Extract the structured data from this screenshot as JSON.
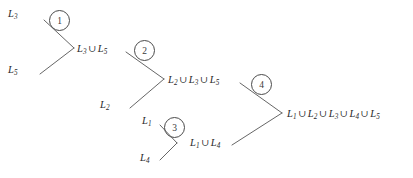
{
  "diagram": {
    "type": "merge-tree",
    "background_color": "#ffffff",
    "line_color": "#555555",
    "text_color": "#2a2a2a",
    "leaves": [
      {
        "id": "leaf-l3",
        "text": "L3",
        "base": "L",
        "sub": "3",
        "x": 8,
        "y": 14
      },
      {
        "id": "leaf-l5",
        "text": "L5",
        "base": "L",
        "sub": "5",
        "x": 8,
        "y": 70
      },
      {
        "id": "leaf-l2",
        "text": "L2",
        "base": "L",
        "sub": "2",
        "x": 100,
        "y": 105
      },
      {
        "id": "leaf-l1",
        "text": "L1",
        "base": "L",
        "sub": "1",
        "x": 142,
        "y": 121
      },
      {
        "id": "leaf-l4",
        "text": "L4",
        "base": "L",
        "sub": "4",
        "x": 140,
        "y": 158
      }
    ],
    "merge_results": [
      {
        "id": "result-1",
        "text": "L3 U L5",
        "x": 77,
        "y": 49,
        "parts": [
          "3",
          "5"
        ]
      },
      {
        "id": "result-2",
        "text": "L2 U L3 U L5",
        "x": 168,
        "y": 80,
        "parts": [
          "2",
          "3",
          "5"
        ]
      },
      {
        "id": "result-3",
        "text": "L1 U L4",
        "x": 190,
        "y": 143,
        "parts": [
          "1",
          "4"
        ]
      },
      {
        "id": "result-4",
        "text": "L1 U L2 U L3 U L4 U L5",
        "x": 287,
        "y": 114,
        "parts": [
          "1",
          "2",
          "3",
          "4",
          "5"
        ]
      }
    ],
    "steps": [
      {
        "id": "step-1",
        "number": "1",
        "x": 49,
        "y": 10
      },
      {
        "id": "step-2",
        "number": "2",
        "x": 134,
        "y": 40
      },
      {
        "id": "step-3",
        "number": "3",
        "x": 164,
        "y": 117
      },
      {
        "id": "step-4",
        "number": "4",
        "x": 251,
        "y": 74
      }
    ],
    "edges": [
      {
        "id": "edge-l3-to-m1",
        "from": [
          44,
          20
        ],
        "to": [
          74,
          48
        ]
      },
      {
        "id": "edge-l5-to-m1",
        "from": [
          40,
          74
        ],
        "to": [
          74,
          48
        ]
      },
      {
        "id": "edge-m1-to-m2",
        "from": [
          126,
          52
        ],
        "to": [
          164,
          79
        ]
      },
      {
        "id": "edge-l2-to-m2",
        "from": [
          130,
          108
        ],
        "to": [
          164,
          79
        ]
      },
      {
        "id": "edge-m2-to-m4",
        "from": [
          240,
          83
        ],
        "to": [
          282,
          113
        ]
      },
      {
        "id": "edge-l1-to-m3",
        "from": [
          160,
          125
        ],
        "to": [
          177,
          143
        ]
      },
      {
        "id": "edge-l4-to-m3",
        "from": [
          160,
          160
        ],
        "to": [
          177,
          143
        ]
      },
      {
        "id": "edge-m3-to-m4",
        "from": [
          232,
          145
        ],
        "to": [
          282,
          113
        ]
      }
    ],
    "union_symbol": "∪"
  }
}
